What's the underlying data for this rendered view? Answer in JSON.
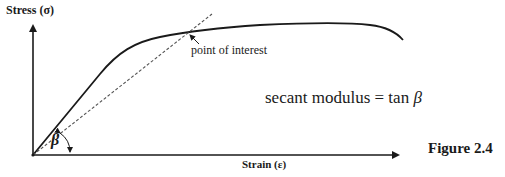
{
  "figure": {
    "caption": "Figure 2.4",
    "y_axis_label": "Stress (σ)",
    "x_axis_label": "Strain (ε)",
    "annotation_point": "point of interest",
    "equation": "secant modulus = tan ",
    "equation_symbol": "β",
    "angle_label": "β",
    "colors": {
      "line": "#1a1a1a",
      "dashed": "#555555",
      "background": "#ffffff"
    }
  }
}
